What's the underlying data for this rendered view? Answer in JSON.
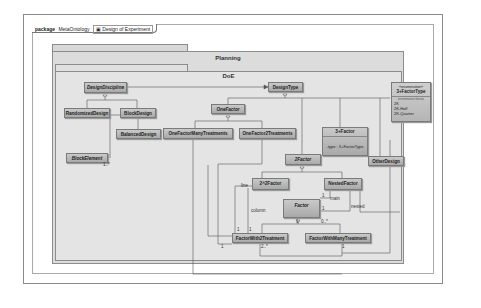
{
  "header": {
    "keyword": "package",
    "package_name": "MetaOntology",
    "diagram_name": "Design of Experiment"
  },
  "packages": {
    "planning": {
      "title": "Planning"
    },
    "doe": {
      "title": "DoE"
    }
  },
  "classes": {
    "design_discipline": {
      "name": "DesignDiscipline",
      "abstract": true
    },
    "randomized_design": {
      "name": "RandomizedDesign"
    },
    "block_design": {
      "name": "BlockDesign"
    },
    "balanced_design": {
      "name": "BalancedDesign"
    },
    "block_element": {
      "name": "BlockElement",
      "abstract": true
    },
    "design_type": {
      "name": "DesignType"
    },
    "one_factor": {
      "name": "OneFactor",
      "abstract": true
    },
    "one_factor_many": {
      "name": "OneFactorManyTreatments"
    },
    "one_factor_2": {
      "name": "OneFactor2Treatments"
    },
    "three_factor": {
      "name": "3+Factor",
      "attribute": "-type : 3+FactorType"
    },
    "other_design": {
      "name": "OtherDesign"
    },
    "two_factor": {
      "name": "2Factor",
      "abstract": true
    },
    "two_2_factor": {
      "name": "2^2Factor"
    },
    "nested_factor": {
      "name": "NestedFactor"
    },
    "factor": {
      "name": "Factor",
      "abstract": true
    },
    "factor_with2": {
      "name": "FactorWith2Treatment"
    },
    "factor_with_many": {
      "name": "FactorWithManyTreatment"
    }
  },
  "enumeration": {
    "stereotype": "«enumeration»",
    "name": "3+FactorType",
    "literals_label": "enumeration literals",
    "literals": [
      "2K",
      "2K-Half",
      "2K-Quarter"
    ]
  },
  "labels": {
    "block_mult": "1..*",
    "line": "line",
    "column": "column",
    "main": "main",
    "nested": "nested",
    "one_a": "1",
    "one_b": "1",
    "one_c": "1",
    "one_d": "1",
    "one_e": "1",
    "one_f": "1",
    "one_g": "1",
    "zero_many": "0..*",
    "two_many": "2..*"
  }
}
